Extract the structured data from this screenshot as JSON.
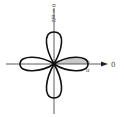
{
  "diagram": {
    "curve": "r = a cos(2θ)",
    "labels": {
      "top_axis": "θ = π/2",
      "right_axis": "0",
      "petal_tip": "a"
    },
    "shaded_region": "upper half of right petal, 0 ≤ θ ≤ π/4",
    "colors": {
      "stroke": "#111111",
      "axis": "#333333",
      "shade": "#c8c8c8",
      "background": "#ffffff"
    }
  }
}
